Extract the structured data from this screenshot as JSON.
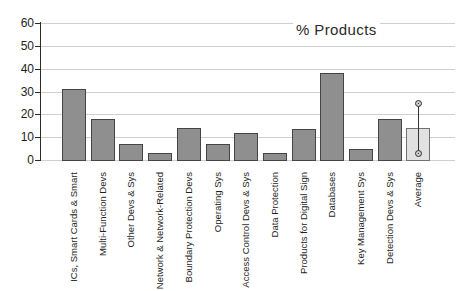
{
  "chart_data": {
    "type": "bar",
    "title": "% Products",
    "categories": [
      "ICs, Smart Cards & Smart",
      "Multi-Function Devs",
      "Other Devs & Sys",
      "Network & Network-Related",
      "Boundary Protection Devs",
      "Operating Sys",
      "Access Control Devs & Sys",
      "Data Protection",
      "Products for Digital Sign",
      "Databases",
      "Key Management Sys",
      "Detection Devs & Sys",
      "Average"
    ],
    "values": [
      31,
      18,
      7,
      3,
      14,
      7,
      12,
      3,
      13.5,
      38,
      5,
      18,
      14
    ],
    "error_bar": {
      "category": "Average",
      "low": 3,
      "high": 25
    },
    "ylim": [
      0,
      60
    ],
    "yticks": [
      0,
      10,
      20,
      30,
      40,
      50,
      60
    ],
    "xlabel": "",
    "ylabel": "",
    "grid": true,
    "legend": false
  },
  "chart_style": {
    "bar_fill": "#8f8f8f",
    "bar_border": "#454545",
    "avg_bar_fill": "#e1e1e1",
    "avg_bar_border": "#707070",
    "grid_color": "#cfcfcf",
    "axis_color": "#2b2b2b",
    "error_color": "#333333",
    "error_cap_fill": "#c9c9c9",
    "background": "#ffffff"
  }
}
